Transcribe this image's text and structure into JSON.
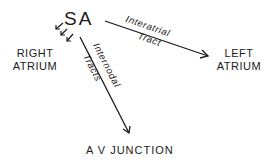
{
  "diagram": {
    "nodes": {
      "sa": "SA",
      "right_atrium": [
        "RIGHT",
        "ATRIUM"
      ],
      "left_atrium": [
        "LEFT",
        "ATRIUM"
      ],
      "av_junction": "A V JUNCTION"
    },
    "edges": [
      {
        "from": "SA",
        "to": "LEFT ATRIUM",
        "label_line1": "Interatrial",
        "label_line2": "Tract"
      },
      {
        "from": "SA",
        "to": "A V JUNCTION",
        "label_line1": "Internodal",
        "label_line2": "Tracts"
      },
      {
        "from": "SA",
        "to": "RIGHT ATRIUM",
        "style": "three small arrows"
      }
    ],
    "colors": {
      "ink": "#1a1a1a",
      "background": "#ffffff"
    }
  }
}
